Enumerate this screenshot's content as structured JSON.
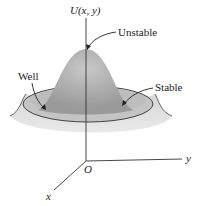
{
  "diagram": {
    "axes": {
      "vertical": "U(x, y)",
      "y": "y",
      "x": "x",
      "origin": "O"
    },
    "labels": {
      "unstable": "Unstable",
      "stable": "Stable",
      "well": "Well"
    },
    "colors": {
      "surface": "#a8a8a8",
      "surface_light": "#d4d4d4",
      "rim_line": "#333333",
      "axis": "#333333"
    }
  }
}
